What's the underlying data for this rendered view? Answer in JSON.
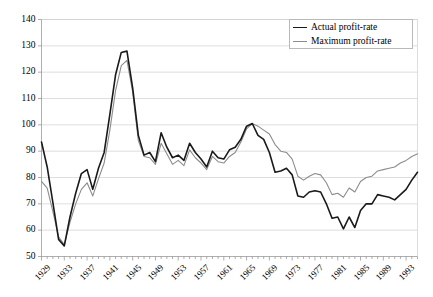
{
  "chart_data": {
    "type": "line",
    "title": "",
    "subtitle": "",
    "xlabel": "",
    "ylabel": "",
    "ylim": [
      50,
      140
    ],
    "ytick_step": 10,
    "yticks": [
      50,
      60,
      70,
      80,
      90,
      100,
      110,
      120,
      130,
      140
    ],
    "xlim": [
      1929,
      1995
    ],
    "xtick_step": 4,
    "xticks": [
      "1929",
      "1933",
      "1937",
      "1941",
      "1945",
      "1949",
      "1953",
      "1957",
      "1961",
      "1965",
      "1969",
      "1973",
      "1977",
      "1981",
      "1985",
      "1989",
      "1993"
    ],
    "x": [
      1929,
      1930,
      1931,
      1932,
      1933,
      1934,
      1935,
      1936,
      1937,
      1938,
      1939,
      1940,
      1941,
      1942,
      1943,
      1944,
      1945,
      1946,
      1947,
      1948,
      1949,
      1950,
      1951,
      1952,
      1953,
      1954,
      1955,
      1956,
      1957,
      1958,
      1959,
      1960,
      1961,
      1962,
      1963,
      1964,
      1965,
      1966,
      1967,
      1968,
      1969,
      1970,
      1971,
      1972,
      1973,
      1974,
      1975,
      1976,
      1977,
      1978,
      1979,
      1980,
      1981,
      1982,
      1983,
      1984,
      1985,
      1986,
      1987,
      1988,
      1989,
      1990,
      1991,
      1992,
      1993,
      1994,
      1995
    ],
    "grid": true,
    "grid_axis": "y",
    "legend_position": "top-right",
    "series": [
      {
        "name": "Actual profit-rate",
        "color": "#1a1a1a",
        "width": 1.6,
        "values": [
          93.5,
          84.0,
          70.5,
          56.5,
          54.0,
          65.0,
          74.0,
          81.5,
          83.0,
          75.5,
          83.5,
          89.5,
          104.0,
          119.0,
          127.5,
          128.0,
          114.0,
          96.0,
          88.5,
          89.5,
          86.0,
          97.0,
          91.5,
          87.5,
          88.5,
          86.5,
          93.0,
          89.5,
          87.0,
          84.0,
          90.0,
          87.5,
          87.0,
          90.5,
          91.5,
          94.5,
          99.5,
          100.5,
          96.0,
          94.5,
          89.5,
          82.0,
          82.5,
          83.5,
          81.0,
          73.0,
          72.5,
          74.5,
          75.0,
          74.5,
          70.0,
          64.5,
          65.0,
          60.5,
          65.0,
          61.0,
          67.5,
          70.0,
          70.0,
          73.5,
          73.0,
          72.5,
          71.5,
          73.5,
          75.5,
          79.0,
          82.0
        ]
      },
      {
        "name": "Maximum profit-rate",
        "color": "#8c8c8c",
        "width": 1.1,
        "values": [
          78.5,
          76.0,
          67.0,
          57.5,
          54.5,
          63.0,
          70.0,
          75.5,
          78.0,
          73.0,
          79.5,
          85.5,
          98.0,
          113.0,
          122.5,
          124.5,
          112.5,
          94.0,
          88.0,
          87.5,
          85.0,
          93.0,
          89.0,
          85.0,
          86.5,
          84.5,
          90.5,
          87.5,
          85.5,
          83.0,
          88.0,
          86.0,
          85.5,
          88.0,
          89.5,
          93.5,
          98.5,
          100.5,
          99.5,
          98.0,
          96.5,
          92.5,
          90.0,
          89.5,
          87.0,
          80.5,
          79.0,
          80.5,
          81.5,
          81.0,
          78.0,
          73.5,
          74.0,
          72.5,
          76.0,
          74.5,
          78.5,
          80.0,
          80.5,
          82.5,
          83.0,
          83.5,
          84.0,
          85.5,
          86.5,
          88.0,
          89.0
        ]
      }
    ]
  },
  "legend": {
    "items": [
      {
        "label": "Actual profit-rate"
      },
      {
        "label": "Maximum profit-rate"
      }
    ]
  }
}
